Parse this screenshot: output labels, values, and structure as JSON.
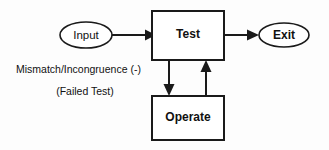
{
  "diagram": {
    "background_color": "#fdfdfd",
    "stroke_color": "#1a1a1a",
    "text_color": "#111111",
    "nodes": [
      {
        "id": "input",
        "label": "Input",
        "shape": "ellipse",
        "bold": false,
        "cx": 86,
        "cy": 35,
        "rx": 26,
        "ry": 13,
        "font_size": 11.5
      },
      {
        "id": "test",
        "label": "Test",
        "shape": "rectangle",
        "bold": true,
        "x": 152,
        "y": 11,
        "width": 72,
        "height": 49,
        "font_size": 12
      },
      {
        "id": "exit",
        "label": "Exit",
        "shape": "ellipse",
        "bold": true,
        "cx": 284,
        "cy": 35,
        "rx": 25,
        "ry": 12,
        "font_size": 12
      },
      {
        "id": "operate",
        "label": "Operate",
        "shape": "rectangle",
        "bold": true,
        "x": 152,
        "y": 96,
        "width": 72,
        "height": 44,
        "font_size": 12
      }
    ],
    "edges": [
      {
        "id": "input-to-test",
        "from": "input",
        "to": "test",
        "direction": "right",
        "label": ""
      },
      {
        "id": "test-to-exit",
        "from": "test",
        "to": "exit",
        "direction": "right",
        "label": ""
      },
      {
        "id": "test-to-operate",
        "from": "test",
        "to": "operate",
        "direction": "down",
        "label": "Mismatch/Incongruence (-)"
      },
      {
        "id": "operate-to-test",
        "from": "operate",
        "to": "test",
        "direction": "up",
        "label": ""
      }
    ],
    "captions": [
      {
        "id": "mismatch-caption",
        "text": "Mismatch/Incongruence (-)",
        "x": 16,
        "y": 70,
        "font_size": 10.5,
        "anchor": "start"
      },
      {
        "id": "failed-test-caption",
        "text": "(Failed Test)",
        "x": 85,
        "y": 92,
        "font_size": 10.5,
        "anchor": "middle"
      }
    ]
  }
}
